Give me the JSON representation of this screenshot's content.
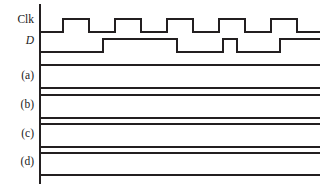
{
  "figure": {
    "type": "digital-timing-diagram",
    "background_color": "#ffffff",
    "stroke_color": "#231f20",
    "stroke_width": 1.6,
    "axis": {
      "name": "time-axis",
      "orientation": "vertical",
      "x": 40,
      "y_top": 4,
      "y_bottom": 184,
      "stroke_width": 1.2
    },
    "plot_area": {
      "x_start": 40,
      "x_end": 320
    },
    "rows": [
      {
        "id": "clk",
        "label": "Clk",
        "label_italic": false,
        "label_x": 30,
        "label_y": 22,
        "kind": "waveform",
        "y_high": 19,
        "y_low": 32
      },
      {
        "id": "d",
        "label": "D",
        "label_italic": true,
        "label_y": 43,
        "kind": "waveform",
        "y_high": 39,
        "y_low": 52
      },
      {
        "id": "a",
        "label": "(a)",
        "label_italic": false,
        "label_y": 78,
        "kind": "blank-rails",
        "y_high": 65,
        "y_low": 88
      },
      {
        "id": "b",
        "label": "(b)",
        "label_italic": false,
        "label_y": 107,
        "kind": "blank-rails",
        "y_high": 95,
        "y_low": 118
      },
      {
        "id": "c",
        "label": "(c)",
        "label_italic": false,
        "label_y": 136,
        "kind": "blank-rails",
        "y_high": 124,
        "y_low": 147
      },
      {
        "id": "d-row",
        "label": "(d)",
        "label_italic": false,
        "label_y": 164,
        "kind": "blank-rails",
        "y_high": 153,
        "y_low": 175
      }
    ],
    "chart_data": {
      "type": "line",
      "title": "",
      "xlabel": "",
      "ylabel": "",
      "description": "Digital timing diagram with a clock signal, a data signal D, and four blank waveform rows labelled (a) through (d) for the reader to fill in.",
      "x_range": [
        40,
        320
      ],
      "grid": false,
      "legend": "none",
      "signal_levels": {
        "low": 0,
        "high": 1
      },
      "series": [
        {
          "name": "Clk",
          "label": "Clk",
          "type": "square-wave",
          "period_px": 52,
          "duty_cycle": 0.5,
          "initial_level": 0,
          "transitions_px": [
            63,
            89,
            115,
            141,
            167,
            193,
            219,
            245,
            271,
            297
          ],
          "levels": [
            0,
            1,
            0,
            1,
            0,
            1,
            0,
            1,
            0,
            1,
            0
          ],
          "pulse_count": 5,
          "y_high": 19,
          "y_low": 32
        },
        {
          "name": "D",
          "label": "D",
          "type": "data-signal",
          "initial_level": 0,
          "transitions_px": [
            103,
            177,
            223,
            237,
            280
          ],
          "levels": [
            0,
            1,
            0,
            1,
            0,
            1
          ],
          "y_high": 39,
          "y_low": 52
        },
        {
          "name": "(a)",
          "label": "(a)",
          "type": "blank",
          "levels": [],
          "y_high": 65,
          "y_low": 88
        },
        {
          "name": "(b)",
          "label": "(b)",
          "type": "blank",
          "levels": [],
          "y_high": 95,
          "y_low": 118
        },
        {
          "name": "(c)",
          "label": "(c)",
          "type": "blank",
          "levels": [],
          "y_high": 124,
          "y_low": 147
        },
        {
          "name": "(d)",
          "label": "(d)",
          "type": "blank",
          "levels": [],
          "y_high": 153,
          "y_low": 175
        }
      ]
    }
  }
}
